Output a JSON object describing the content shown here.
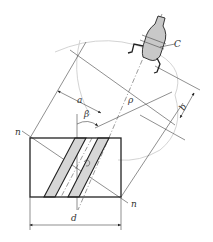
{
  "diagram": {
    "labels": {
      "nozzle": "C",
      "center": "C",
      "a": "a",
      "beta": "β",
      "rho": "ρ",
      "b": "b",
      "n_top": "n",
      "n_bottom": "n",
      "d": "d"
    },
    "colors": {
      "line": "#222222",
      "fill_band": "#d6d6d6",
      "nozzle_fill": "#c8c8c8",
      "arc": "#c8c8c8"
    }
  }
}
